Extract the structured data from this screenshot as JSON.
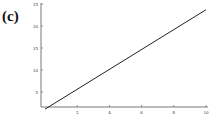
{
  "panel": {
    "label": "(c)"
  },
  "chart_data": {
    "type": "line",
    "title": "",
    "xlabel": "",
    "ylabel": "",
    "xlim": [
      0,
      10
    ],
    "ylim": [
      0,
      25
    ],
    "xticks": [
      "2",
      "4",
      "6",
      "8",
      "10"
    ],
    "yticks": [
      "5",
      "10",
      "15",
      "20",
      "25"
    ],
    "grid": false,
    "legend": null,
    "series": [
      {
        "name": "line",
        "x": [
          0,
          10
        ],
        "y": [
          1.1,
          23.7
        ],
        "color": "#222222"
      }
    ]
  }
}
